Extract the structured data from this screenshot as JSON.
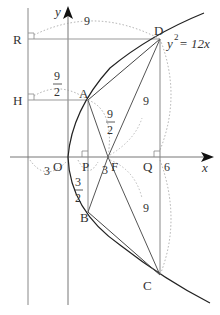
{
  "diagram": {
    "equation": "y² = 12x",
    "equation_base": "y",
    "equation_exp": "2",
    "equation_rest": " = 12x",
    "axes": {
      "x_label": "x",
      "y_label": "y"
    },
    "points": {
      "O": "O",
      "P": "P",
      "F": "F",
      "Q": "Q",
      "A": "A",
      "B": "B",
      "C": "C",
      "D": "D",
      "H": "H",
      "R": "R"
    },
    "measures": {
      "RD": "9",
      "HA_num": "9",
      "HA_den": "2",
      "AF_num": "9",
      "AF_den": "2",
      "DQ": "9",
      "QC": "9",
      "OF_left": "3",
      "PF": "3",
      "PB_num": "3",
      "PB_den": "2",
      "Q_x": "6"
    }
  }
}
